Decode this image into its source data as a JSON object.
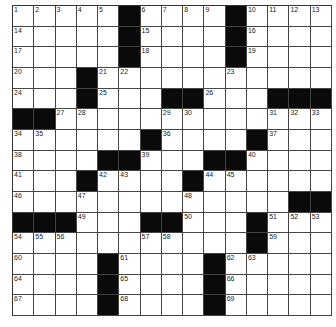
{
  "puzzle": {
    "rows": 15,
    "cols": 15,
    "colors": {
      "black": "#0a0a0a",
      "white": "#ffffff",
      "line": "#444444"
    },
    "grid": [
      [
        "1",
        "2",
        "3",
        "4",
        "5",
        "#",
        "6",
        "7",
        "8",
        "9",
        "#",
        "10",
        "11",
        "12",
        "13"
      ],
      [
        "14",
        "",
        "",
        "",
        "",
        "#",
        "15",
        "",
        "",
        "",
        "#",
        "16",
        "",
        "",
        ""
      ],
      [
        "17",
        "",
        "",
        "",
        "",
        "#",
        "18",
        "",
        "",
        "",
        "#",
        "19",
        "",
        "",
        ""
      ],
      [
        "20",
        "",
        "",
        "#",
        "21",
        "22",
        "",
        "",
        "",
        "",
        "23",
        "",
        "",
        "",
        ""
      ],
      [
        "24",
        "",
        "",
        "#",
        "25",
        "",
        "",
        "#",
        "#",
        "26",
        "",
        "",
        "#",
        "#",
        "#"
      ],
      [
        "#",
        "#",
        "27",
        "28",
        "",
        "",
        "",
        "29",
        "30",
        "",
        "",
        "",
        "31",
        "32",
        "33"
      ],
      [
        "34",
        "35",
        "",
        "",
        "",
        "",
        "#",
        "36",
        "",
        "",
        "",
        "#",
        "37",
        "",
        ""
      ],
      [
        "38",
        "",
        "",
        "",
        "#",
        "#",
        "39",
        "",
        "",
        "#",
        "#",
        "40",
        "",
        "",
        ""
      ],
      [
        "41",
        "",
        "",
        "#",
        "42",
        "43",
        "",
        "",
        "#",
        "44",
        "45",
        "",
        "",
        "",
        ""
      ],
      [
        "46",
        "",
        "",
        "47",
        "",
        "",
        "",
        "",
        "48",
        "",
        "",
        "",
        "",
        "#",
        "#"
      ],
      [
        "#",
        "#",
        "#",
        "49",
        "",
        "",
        "#",
        "#",
        "50",
        "",
        "",
        "#",
        "51",
        "52",
        "53"
      ],
      [
        "54",
        "55",
        "56",
        "",
        "",
        "",
        "57",
        "58",
        "",
        "",
        "",
        "#",
        "59",
        "",
        ""
      ],
      [
        "60",
        "",
        "",
        "",
        "#",
        "61",
        "",
        "",
        "",
        "#",
        "62",
        "63",
        "",
        "",
        ""
      ],
      [
        "64",
        "",
        "",
        "",
        "#",
        "65",
        "",
        "",
        "",
        "#",
        "66",
        "",
        "",
        "",
        ""
      ],
      [
        "67",
        "",
        "",
        "",
        "#",
        "68",
        "",
        "",
        "",
        "#",
        "69",
        "",
        "",
        "",
        ""
      ]
    ]
  }
}
